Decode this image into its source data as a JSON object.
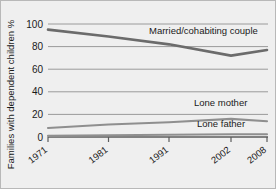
{
  "chart_data": {
    "type": "line",
    "title": "",
    "xlabel": "",
    "ylabel": "Families with dependent children %",
    "x": [
      1971,
      1981,
      1991,
      2002,
      2008
    ],
    "xtick_labels": [
      "1971",
      "1981",
      "1991",
      "2002",
      "2008"
    ],
    "ytick_labels": [
      "0",
      "20",
      "40",
      "60",
      "80",
      "100"
    ],
    "ytick_values": [
      0,
      20,
      40,
      60,
      80,
      100
    ],
    "ylim": [
      0,
      100
    ],
    "grid": true,
    "legend": "inline-labels",
    "series": [
      {
        "name": "Married/cohabiting couple",
        "values": [
          95,
          89,
          82,
          72,
          77
        ],
        "color": "#6b6b6b",
        "label_x": 148,
        "label_y": 33
      },
      {
        "name": "Lone mother",
        "values": [
          8,
          11,
          13,
          16,
          14
        ],
        "color": "#8f8f8f",
        "label_x": 193,
        "label_y": 105
      },
      {
        "name": "Lone father",
        "values": [
          1,
          1.5,
          2,
          2.5,
          2.5
        ],
        "color": "#8f8f8f",
        "label_x": 196,
        "label_y": 126
      }
    ]
  },
  "colors": {
    "background": "#efefef",
    "frame_border": "#b8b8b8",
    "grid": "#9a9a9a",
    "axis": "#5c5c5c",
    "text": "#1a1a1a"
  }
}
